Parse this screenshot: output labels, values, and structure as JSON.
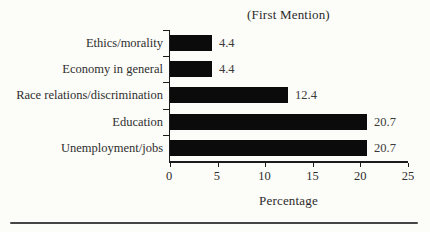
{
  "chart_data": {
    "type": "bar",
    "orientation": "horizontal",
    "title": "(First Mention)",
    "categories": [
      "Ethics/morality",
      "Economy in general",
      "Race relations/discrimination",
      "Education",
      "Unemployment/jobs"
    ],
    "values": [
      4.4,
      4.4,
      12.4,
      20.7,
      20.7
    ],
    "value_labels": [
      "4.4",
      "4.4",
      "12.4",
      "20.7",
      "20.7"
    ],
    "xlabel": "Percentage",
    "xlim": [
      0,
      25
    ],
    "xticks": [
      "0",
      "5",
      "10",
      "15",
      "20",
      "25"
    ],
    "grid": false,
    "legend": "none",
    "bar_color": "#0b0b0b"
  },
  "colors": {
    "background": "#fcfcf8",
    "axis": "#1b1b1b",
    "text": "#2b2b2b",
    "bottom_rule": "#454545"
  }
}
